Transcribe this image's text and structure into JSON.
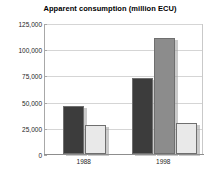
{
  "chart_data": {
    "type": "bar",
    "title": "Apparent consumption (million ECU)",
    "xlabel": "",
    "ylabel": "",
    "categories": [
      "1988",
      "1998"
    ],
    "series": [
      {
        "name": "series-1-dark",
        "color": "#3c3c3c",
        "values": [
          46000,
          72500
        ]
      },
      {
        "name": "series-2-medium",
        "color": "#8c8c8c",
        "values": [
          null,
          111000
        ]
      },
      {
        "name": "series-3-light",
        "color": "#e9e9e9",
        "values": [
          28000,
          29500
        ]
      }
    ],
    "ylim": [
      0,
      125000
    ],
    "yticks": [
      0,
      25000,
      50000,
      75000,
      100000,
      125000
    ],
    "ytick_labels": [
      "0",
      "25,000",
      "50,000",
      "75,000",
      "100,000",
      "125,000"
    ],
    "grid": true,
    "legend": false,
    "legend_position": "none"
  },
  "colors": {
    "background": "#ffffff",
    "grid": "#d5d5d5",
    "axis": "#a8a8a8",
    "text": "#262626",
    "title": "#000000",
    "bar_border": "#6f6f6f",
    "bar_shadow": "#9e9e9e"
  }
}
